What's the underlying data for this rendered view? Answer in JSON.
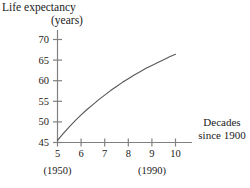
{
  "chart_data": {
    "type": "line",
    "title": "Life expectancy (years)",
    "title_lines": [
      "Life expectancy",
      "(years)"
    ],
    "ylabel": "Life expectancy (years)",
    "xlabel": "Decades since 1900",
    "xlabel_lines": [
      "Decades",
      "since 1900"
    ],
    "grid": false,
    "legend": "none",
    "xlim": [
      5,
      10.6
    ],
    "ylim": [
      45,
      72
    ],
    "xticks": [
      5,
      6,
      7,
      8,
      9,
      10
    ],
    "xtick_labels": [
      "5",
      "6",
      "7",
      "8",
      "9",
      "10"
    ],
    "yticks": [
      45,
      50,
      55,
      60,
      65,
      70
    ],
    "ytick_labels": [
      "45",
      "50",
      "55",
      "60",
      "65",
      "70"
    ],
    "annotations": [
      {
        "text": "(1950)",
        "at_x": 5
      },
      {
        "text": "(1990)",
        "at_x": 9
      }
    ],
    "x": [
      5.0,
      5.25,
      5.5,
      5.75,
      6.0,
      6.25,
      6.5,
      6.75,
      7.0,
      7.25,
      7.5,
      7.75,
      8.0,
      8.25,
      8.5,
      8.75,
      9.0,
      9.25,
      9.5,
      9.75,
      10.0
    ],
    "values": [
      45.5,
      47.2,
      48.8,
      50.3,
      51.7,
      53.0,
      54.2,
      55.4,
      56.5,
      57.6,
      58.6,
      59.6,
      60.5,
      61.4,
      62.2,
      63.0,
      63.7,
      64.4,
      65.1,
      65.8,
      66.4
    ],
    "series": [
      {
        "name": "Life expectancy",
        "color": "#595959",
        "values": [
          45.5,
          47.2,
          48.8,
          50.3,
          51.7,
          53.0,
          54.2,
          55.4,
          56.5,
          57.6,
          58.6,
          59.6,
          60.5,
          61.4,
          62.2,
          63.0,
          63.7,
          64.4,
          65.1,
          65.8,
          66.4
        ]
      }
    ]
  },
  "colors": {
    "axis": "#808080",
    "curve": "#595959",
    "text": "#1a1a1a",
    "background": "#ffffff"
  }
}
